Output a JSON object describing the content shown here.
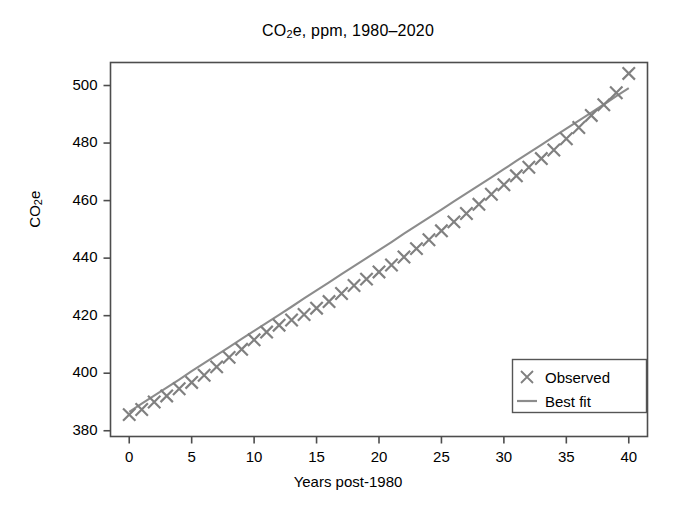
{
  "chart_data": {
    "type": "scatter",
    "title_parts": {
      "pre": "CO",
      "sub": "2",
      "post": "e, ppm, 1980–2020"
    },
    "xlabel": "Years post-1980",
    "ylabel": "CO2e",
    "ylabel_parts": {
      "pre": "CO",
      "sub": "2",
      "post": "e"
    },
    "xlim": [
      -1.5,
      41.5
    ],
    "ylim": [
      378,
      508
    ],
    "grid": false,
    "legend_position": "lower right",
    "xticks": [
      0,
      5,
      10,
      15,
      20,
      25,
      30,
      35,
      40
    ],
    "xtick_labels": [
      "0",
      "5",
      "10",
      "15",
      "20",
      "25",
      "30",
      "35",
      "40"
    ],
    "yticks": [
      380,
      400,
      420,
      440,
      460,
      480,
      500
    ],
    "ytick_labels": [
      "380",
      "400",
      "420",
      "440",
      "460",
      "480",
      "500"
    ],
    "x": [
      0,
      1,
      2,
      3,
      4,
      5,
      6,
      7,
      8,
      9,
      10,
      11,
      12,
      13,
      14,
      15,
      16,
      17,
      18,
      19,
      20,
      21,
      22,
      23,
      24,
      25,
      26,
      27,
      28,
      29,
      30,
      31,
      32,
      33,
      34,
      35,
      36,
      37,
      38,
      39,
      40
    ],
    "series": [
      {
        "name": "Observed",
        "marker": "x",
        "color": "#808080",
        "values": [
          385.6,
          387.4,
          390.0,
          392.1,
          394.6,
          396.8,
          399.3,
          402.2,
          405.5,
          408.3,
          411.6,
          414.3,
          416.7,
          418.5,
          420.4,
          422.6,
          424.9,
          427.7,
          430.5,
          432.7,
          435.2,
          437.6,
          440.4,
          443.3,
          446.4,
          449.5,
          452.6,
          455.5,
          458.7,
          462.2,
          465.5,
          468.6,
          471.6,
          474.6,
          477.6,
          481.5,
          485.4,
          489.6,
          493.3,
          497.5,
          504.2
        ]
      },
      {
        "name": "Best fit",
        "marker": "line",
        "color": "#8c8c8c",
        "intercept": 386.6,
        "slope": 2.81,
        "values": [
          386.6,
          389.4,
          392.2,
          395.0,
          397.8,
          400.7,
          403.5,
          406.3,
          409.1,
          411.9,
          414.7,
          417.5,
          420.3,
          423.1,
          426.0,
          428.8,
          431.6,
          434.4,
          437.2,
          440.0,
          442.8,
          445.6,
          448.5,
          451.3,
          454.1,
          456.9,
          459.7,
          462.5,
          465.3,
          468.1,
          470.9,
          473.8,
          476.6,
          479.4,
          482.2,
          485.0,
          487.8,
          490.6,
          493.4,
          496.3,
          499.1
        ]
      }
    ],
    "legend": [
      {
        "label": "Observed",
        "marker": "x",
        "color": "#808080"
      },
      {
        "label": "Best fit",
        "marker": "line",
        "color": "#8c8c8c"
      }
    ]
  },
  "style": {
    "background": "#ffffff",
    "axis_color": "#4d4d4d",
    "text_color": "#000000",
    "data_color": "#808080",
    "fit_color": "#8c8c8c",
    "legend_border": "#555555"
  }
}
